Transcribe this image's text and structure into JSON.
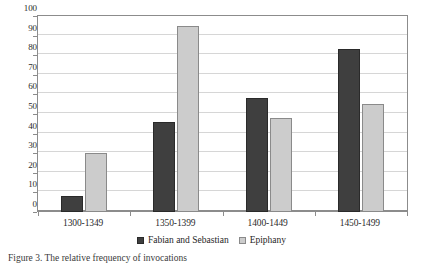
{
  "chart_data": {
    "type": "bar",
    "title": "",
    "xlabel": "",
    "ylabel": "",
    "categories": [
      "1300-1349",
      "1350-1399",
      "1400-1449",
      "1450-1499"
    ],
    "series": [
      {
        "name": "Fabian and Sebastian",
        "color": "#3f3f3f",
        "values": [
          8,
          46,
          58,
          83
        ]
      },
      {
        "name": "Epiphany",
        "color": "#cccccc",
        "values": [
          30,
          95,
          48,
          55
        ]
      }
    ],
    "ylim": [
      0,
      100
    ],
    "ytick_labels": [
      "0",
      "10",
      "20",
      "30",
      "40",
      "50",
      "60",
      "70",
      "80",
      "90",
      "100"
    ],
    "ytick_values": [
      0,
      10,
      20,
      30,
      40,
      50,
      60,
      70,
      80,
      90,
      100
    ],
    "grid": "horizontal",
    "legend_position": "bottom-center"
  },
  "caption": {
    "text": "Figure 3. The relative frequency of invocations"
  }
}
